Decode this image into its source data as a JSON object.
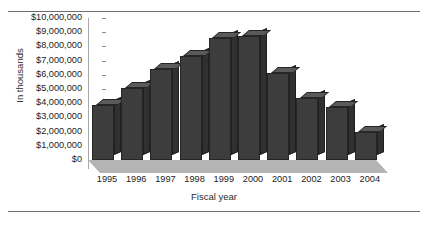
{
  "chart_data": {
    "type": "bar",
    "title": "",
    "subtitle": "",
    "xlabel": "Fiscal year",
    "ylabel": "In thousands",
    "categories": [
      "1995",
      "1996",
      "1997",
      "1998",
      "1999",
      "2000",
      "2001",
      "2002",
      "2003",
      "2004"
    ],
    "values": [
      3900000,
      5100000,
      6400000,
      7300000,
      8600000,
      8700000,
      6100000,
      4400000,
      3700000,
      2000000
    ],
    "ylim": [
      0,
      10000000
    ],
    "ytick_values": [
      0,
      1000000,
      2000000,
      3000000,
      4000000,
      5000000,
      6000000,
      7000000,
      8000000,
      9000000,
      10000000
    ],
    "ytick_labels": [
      "$10,000,000",
      "$9,000,000",
      "$8,000,000",
      "$7,000,000",
      "$6,000,000",
      "$5,000,000",
      "$4,000,000",
      "$3,000,000",
      "$2,000,000",
      "$1,000,000",
      "$0"
    ],
    "grid": false,
    "legend": null,
    "legend_position": "none",
    "style": "3d-column",
    "colors": {
      "bar_front": "#3d3d3d",
      "bar_side": "#303030",
      "bar_top": "#5a5a5a",
      "floor": "#b4b4b4",
      "axis": "#a8a8a8",
      "rule": "#6d6d6d",
      "text": "#1c1c1c",
      "background": "#ffffff"
    }
  }
}
